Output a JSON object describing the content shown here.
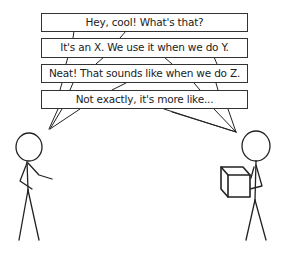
{
  "comic": {
    "dialogue": [
      {
        "speaker": "left",
        "text": "Hey, cool! What's that?"
      },
      {
        "speaker": "right",
        "text": "It's an X. We use it when we do Y."
      },
      {
        "speaker": "left",
        "text": "Neat! That sounds like when we do Z."
      },
      {
        "speaker": "right",
        "text": "Not exactly, it's more like..."
      }
    ],
    "characters": {
      "left": {
        "description": "stick figure gesturing"
      },
      "right": {
        "description": "stick figure holding a box",
        "prop": "box-icon"
      }
    },
    "colors": {
      "ink": "#222222",
      "background": "#ffffff"
    }
  }
}
